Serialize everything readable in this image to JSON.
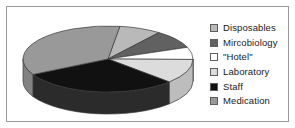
{
  "chart_data": {
    "type": "pie",
    "title": "",
    "subtitle": "",
    "xlabel": "",
    "ylabel": "",
    "grid": false,
    "legend_position": "right",
    "three_d": true,
    "categories": [
      "Disposables",
      "Mircobiology",
      "\"Hotel\"",
      "Laboratory",
      "Staff",
      "Medication"
    ],
    "values": [
      8,
      9,
      6,
      12,
      30,
      35
    ],
    "units": "percent",
    "colors": [
      "#b9b9b9",
      "#616161",
      "#ffffff",
      "#dcdcdc",
      "#111111",
      "#999999"
    ],
    "slices": [
      {
        "label": "Disposables",
        "value": 8,
        "color": "#b9b9b9",
        "side_color": "#a1a1a1"
      },
      {
        "label": "Mircobiology",
        "value": 9,
        "color": "#616161",
        "side_color": "#4e4e4e"
      },
      {
        "label": "\"Hotel\"",
        "value": 6,
        "color": "#ffffff",
        "side_color": "#dedede"
      },
      {
        "label": "Laboratory",
        "value": 12,
        "color": "#dcdcdc",
        "side_color": "#bdbdbd"
      },
      {
        "label": "Staff",
        "value": 30,
        "color": "#111111",
        "side_color": "#2b2b2b"
      },
      {
        "label": "Medication",
        "value": 35,
        "color": "#999999",
        "side_color": "#828282"
      }
    ]
  },
  "legend": {
    "items": [
      {
        "label": "Disposables",
        "color": "#b9b9b9"
      },
      {
        "label": "Mircobiology",
        "color": "#616161"
      },
      {
        "label": "\"Hotel\"",
        "color": "#ffffff"
      },
      {
        "label": "Laboratory",
        "color": "#dcdcdc"
      },
      {
        "label": "Staff",
        "color": "#111111"
      },
      {
        "label": "Medication",
        "color": "#999999"
      }
    ]
  },
  "frame": {
    "border_color": "#9a9a9a",
    "background": "#ffffff"
  }
}
